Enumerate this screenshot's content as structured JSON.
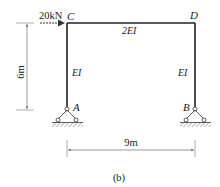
{
  "figure": {
    "caption": "(b)",
    "type": "portal frame structural diagram"
  },
  "nodes": {
    "C": {
      "label": "C",
      "x": 67,
      "y": 23
    },
    "D": {
      "label": "D",
      "x": 195,
      "y": 23
    },
    "A": {
      "label": "A",
      "x": 67,
      "y": 110,
      "support": "pin"
    },
    "B": {
      "label": "B",
      "x": 195,
      "y": 110,
      "support": "pin"
    }
  },
  "members": [
    {
      "name": "beam-CD",
      "from": "C",
      "to": "D",
      "stiffness": "2EI"
    },
    {
      "name": "column-AC",
      "from": "A",
      "to": "C",
      "stiffness": "EI"
    },
    {
      "name": "column-BD",
      "from": "B",
      "to": "D",
      "stiffness": "EI"
    }
  ],
  "loads": [
    {
      "label": "20kN",
      "at": "C",
      "direction": "right"
    }
  ],
  "dimensions": {
    "height": "6m",
    "span": "9m"
  },
  "colors": {
    "member": "#222222",
    "dimension": "#555555",
    "hatch": "#555555"
  }
}
